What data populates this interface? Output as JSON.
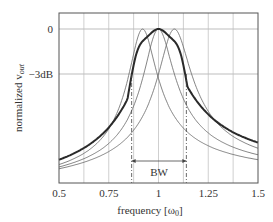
{
  "chart_data": {
    "type": "line",
    "title": "",
    "xlabel": "frequency [ω0]",
    "ylabel": "normalized v_out",
    "xlim": [
      0.5,
      1.5
    ],
    "x_ticks": [
      "0.5",
      "0.75",
      "1",
      "1.25",
      "1.5"
    ],
    "x_tick_values": [
      0.5,
      0.75,
      1.0,
      1.25,
      1.5
    ],
    "x_minor_grid": [
      0.625,
      0.875,
      1.125,
      1.375
    ],
    "y_ticks": [
      "0",
      "−3dB"
    ],
    "grid": true,
    "legend": null,
    "annotations": [
      {
        "text": "BW",
        "from_x": 0.865,
        "to_x": 1.14,
        "type": "double-arrow"
      }
    ],
    "bandwidth_markers": [
      0.865,
      1.14
    ],
    "series": [
      {
        "name": "resonator 1",
        "style": "thin",
        "center": 0.92,
        "q": 6.5
      },
      {
        "name": "resonator 2",
        "style": "thin",
        "center": 1.0,
        "q": 6.5
      },
      {
        "name": "resonator 3",
        "style": "thin",
        "center": 1.08,
        "q": 6.5
      },
      {
        "name": "combined response",
        "style": "thick",
        "x": [
          0.5,
          0.6,
          0.7,
          0.8,
          0.85,
          0.88,
          0.9,
          0.92,
          0.96,
          1.0,
          1.04,
          1.08,
          1.1,
          1.12,
          1.15,
          1.2,
          1.3,
          1.4,
          1.5
        ],
        "y_normalized": [
          0.18,
          0.24,
          0.33,
          0.52,
          0.72,
          0.88,
          0.97,
          1.0,
          0.965,
          1.0,
          0.965,
          1.0,
          0.97,
          0.88,
          0.72,
          0.52,
          0.33,
          0.24,
          0.18
        ]
      }
    ]
  },
  "labels": {
    "y0": "0",
    "y3db": "−3dB",
    "bw": "BW",
    "xlabel_main": "frequency [ω",
    "xlabel_sub": "0",
    "xlabel_end": "]",
    "ylabel_main": "normalized v",
    "ylabel_sub": "out"
  }
}
